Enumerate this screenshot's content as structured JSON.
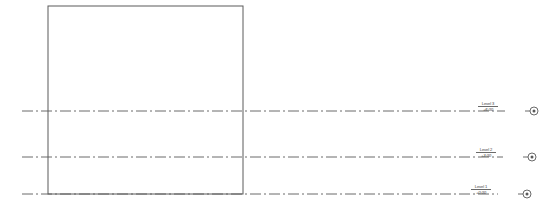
{
  "drawing": {
    "type": "architectural-elevation",
    "background_color": "#ffffff",
    "line_color": "#5a5a5a",
    "text_color": "#3d3d3d",
    "building_outline": {
      "x": 48,
      "y": 6,
      "width": 195,
      "height": 188,
      "stroke_width": 1.0
    },
    "levels": [
      {
        "name": "Level 3",
        "elevation": "+6.00",
        "line_y": 111,
        "line_start_x": 22,
        "line_end_x": 505,
        "label_x": 505,
        "marker_x": 534
      },
      {
        "name": "Level 2",
        "elevation": "+3.00",
        "line_y": 157,
        "line_start_x": 22,
        "line_end_x": 503,
        "label_x": 503,
        "marker_x": 532
      },
      {
        "name": "Level 1",
        "elevation": "+0.00",
        "line_y": 194,
        "line_start_x": 22,
        "line_end_x": 498,
        "label_x": 498,
        "marker_x": 527
      }
    ],
    "marker": {
      "icon": "level-datum-circle-icon",
      "radius": 4.0,
      "inner_radius": 1.5,
      "leader_length": 5
    }
  }
}
